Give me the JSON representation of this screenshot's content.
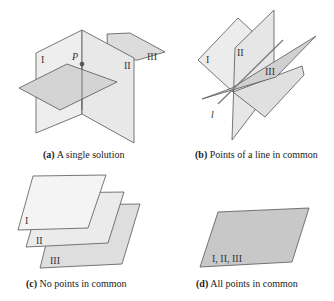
{
  "panels": [
    {
      "id": "a",
      "letter": "(a)",
      "caption": "A single solution",
      "labels": [
        "I",
        "II",
        "III"
      ],
      "point_label": "P"
    },
    {
      "id": "b",
      "letter": "(b)",
      "caption": "Points of a line in common",
      "labels": [
        "I",
        "II",
        "III"
      ],
      "line_label": "l"
    },
    {
      "id": "c",
      "letter": "(c)",
      "caption": "No points in common",
      "labels": [
        "I",
        "II",
        "III"
      ]
    },
    {
      "id": "d",
      "letter": "(d)",
      "caption": "All points in common",
      "labels": [
        "I, II, III"
      ]
    }
  ],
  "colors": {
    "plane_light": "#ebebeb",
    "plane_mid": "#d9d9d9",
    "plane_dark": "#c4c4c4",
    "edge": "#555555"
  }
}
